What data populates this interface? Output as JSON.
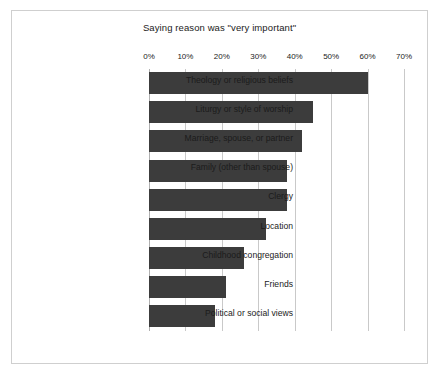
{
  "chart_data": {
    "type": "bar",
    "orientation": "horizontal",
    "title": "Saying reason was \"very important\"",
    "xlabel": "",
    "ylabel": "",
    "categories": [
      "Theology or religious beliefs",
      "Liturgy or style of worship",
      "Marriage, spouse, or partner",
      "Family (other than spouse)",
      "Clergy",
      "Location",
      "Childhood congregation",
      "Friends",
      "Political or social views"
    ],
    "values": [
      60,
      45,
      42,
      38,
      38,
      32,
      26,
      21,
      18
    ],
    "value_unit": "%",
    "xlim": [
      0,
      70
    ],
    "xticks": [
      0,
      10,
      20,
      30,
      40,
      50,
      60,
      70
    ],
    "xtick_labels": [
      "0%",
      "10%",
      "20%",
      "30%",
      "40%",
      "50%",
      "60%",
      "70%"
    ],
    "grid": "vertical",
    "legend": null,
    "bar_color": "#3c3c3c",
    "background_color": "#ffffff",
    "frame_color": "#cfcfcf",
    "gridline_color": "#c9c9c9"
  }
}
